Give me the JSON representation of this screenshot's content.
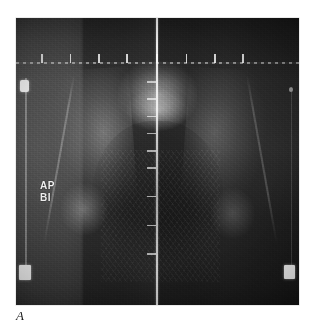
{
  "figure": {
    "label": "A",
    "modality": "dual-energy x-ray absorptiometry radiograph",
    "region": "pelvis / bilateral proximal femur"
  },
  "scan": {
    "annotation_lines": [
      "AP",
      "BI"
    ],
    "annotation_full": "AP BI",
    "midline_vertical_name": "midline reference line",
    "midline_horizontal_name": "horizontal reference line"
  },
  "markers": {
    "left_top": "calibration-marker",
    "left_bottom": "calibration-marker",
    "right_bottom": "calibration-marker",
    "right_top": "calibration-marker"
  },
  "anatomy": {
    "spine": "lumbosacral spine",
    "pelvic_inlet": "pelvic inlet",
    "left_wing": "left iliac wing",
    "right_wing": "right iliac wing",
    "left_femur": "left proximal femur",
    "right_femur": "right proximal femur"
  },
  "colors": {
    "page_background": "#ffffff",
    "scan_background": "#3a3a3a",
    "scan_dark": "#1f1f1f",
    "scan_light": "#4e4e4e",
    "reference_line": "#ffffff",
    "marker": "#f3f3f3",
    "annotation_text": "#f2f2f2",
    "caption_text": "#1b1b1b"
  },
  "geometry": {
    "page_width": 316,
    "page_height": 325,
    "scan_left": 16,
    "scan_top": 18,
    "scan_width": 283,
    "scan_height": 287
  },
  "ticks": {
    "horizontal_tick_positions_pct": [
      9,
      19,
      29,
      39,
      49.6,
      60,
      70,
      80
    ],
    "vertical_tick_positions_pct": [
      22,
      28,
      34,
      40,
      46,
      52,
      62,
      72,
      82
    ]
  }
}
